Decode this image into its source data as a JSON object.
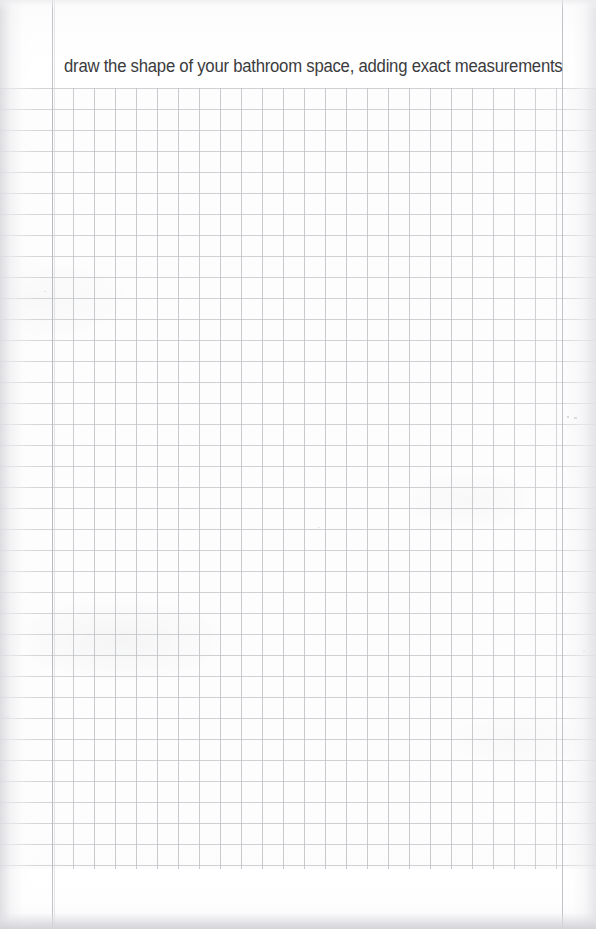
{
  "page": {
    "kind": "worksheet-page",
    "width": 596,
    "height": 929,
    "paper_color": "#fdfdfd",
    "ink_color": "#3b3b3d",
    "grid_line_color": "#c4c5c9",
    "margin_rule_color": "#b6b7bd"
  },
  "header": {
    "instruction": "draw the shape of your bathroom space, adding exact measurements"
  },
  "grid": {
    "label": "graph-paper-drawing-area",
    "cell_size_px": 21,
    "horizontal_rules": {
      "start_y": 88,
      "end_y": 868,
      "spans_full_width": true,
      "count": 38
    },
    "vertical_rules": {
      "start_x": 52,
      "end_x": 562,
      "count": 25
    },
    "left_margin_rule_x": 52,
    "right_margin_rule_x": 562
  },
  "footer": {
    "note": ""
  }
}
